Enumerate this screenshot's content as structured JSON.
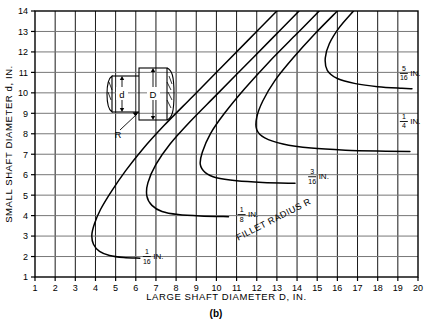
{
  "figure": {
    "caption": "(b)",
    "xlabel": "LARGE SHAFT DIAMETER D, IN.",
    "ylabel": "SMALL SHAFT DIAMETER d, IN.",
    "annotation": "FILLET RADIUS R",
    "inset": {
      "small_diameter_label": "d",
      "large_diameter_label": "D",
      "radius_label": "R"
    },
    "curve_labels": [
      {
        "num": "1",
        "den": "16",
        "unit": "IN."
      },
      {
        "num": "1",
        "den": "8",
        "unit": "IN."
      },
      {
        "num": "3",
        "den": "16",
        "unit": "IN."
      },
      {
        "num": "1",
        "den": "4",
        "unit": "IN."
      },
      {
        "num": "5",
        "den": "16",
        "unit": "IN."
      }
    ]
  },
  "chart_data": {
    "type": "line",
    "title": "",
    "xlabel": "LARGE SHAFT DIAMETER D, IN.",
    "ylabel": "SMALL SHAFT DIAMETER d, IN.",
    "xlim": [
      1,
      20
    ],
    "ylim": [
      1,
      14
    ],
    "xticks": [
      1,
      2,
      3,
      4,
      5,
      6,
      7,
      8,
      9,
      10,
      11,
      12,
      13,
      14,
      15,
      16,
      17,
      18,
      19,
      20
    ],
    "yticks": [
      1,
      2,
      3,
      4,
      5,
      6,
      7,
      8,
      9,
      10,
      11,
      12,
      13,
      14
    ],
    "xtick_labels": [
      "1",
      "2",
      "3",
      "4",
      "5",
      "6",
      "7",
      "8",
      "9",
      "10",
      "11",
      "12",
      "13",
      "14",
      "15",
      "16",
      "17",
      "18",
      "19",
      "20"
    ],
    "ytick_labels": [
      "1",
      "2",
      "3",
      "4",
      "5",
      "6",
      "7",
      "8",
      "9",
      "10",
      "11",
      "12",
      "13",
      "14"
    ],
    "grid": true,
    "legend": "inline labels on curves",
    "annotations": [
      "FILLET RADIUS R",
      "(b)"
    ],
    "series": [
      {
        "name": "1/16 IN.",
        "label": "1/16 IN.",
        "label_at": {
          "x": 6.35,
          "y": 2.0
        },
        "points": [
          {
            "x": 13.0,
            "y": 14.0
          },
          {
            "x": 11.6,
            "y": 12.6
          },
          {
            "x": 10.2,
            "y": 11.2
          },
          {
            "x": 8.8,
            "y": 9.8
          },
          {
            "x": 7.4,
            "y": 8.4
          },
          {
            "x": 6.3,
            "y": 7.2
          },
          {
            "x": 5.5,
            "y": 6.2
          },
          {
            "x": 4.8,
            "y": 5.2
          },
          {
            "x": 4.25,
            "y": 4.3
          },
          {
            "x": 3.95,
            "y": 3.6
          },
          {
            "x": 3.82,
            "y": 3.05
          },
          {
            "x": 3.9,
            "y": 2.6
          },
          {
            "x": 4.2,
            "y": 2.25
          },
          {
            "x": 4.7,
            "y": 2.05
          },
          {
            "x": 5.4,
            "y": 1.95
          },
          {
            "x": 6.2,
            "y": 1.92
          }
        ]
      },
      {
        "name": "1/8 IN.",
        "label": "1/8 IN.",
        "label_at": {
          "x": 11.05,
          "y": 4.05
        },
        "points": [
          {
            "x": 14.1,
            "y": 14.0
          },
          {
            "x": 12.8,
            "y": 12.7
          },
          {
            "x": 11.4,
            "y": 11.3
          },
          {
            "x": 10.0,
            "y": 9.9
          },
          {
            "x": 8.7,
            "y": 8.6
          },
          {
            "x": 7.7,
            "y": 7.5
          },
          {
            "x": 7.0,
            "y": 6.5
          },
          {
            "x": 6.6,
            "y": 5.6
          },
          {
            "x": 6.55,
            "y": 4.95
          },
          {
            "x": 6.8,
            "y": 4.5
          },
          {
            "x": 7.3,
            "y": 4.2
          },
          {
            "x": 8.1,
            "y": 4.05
          },
          {
            "x": 9.2,
            "y": 3.98
          },
          {
            "x": 10.6,
            "y": 3.95
          }
        ]
      },
      {
        "name": "3/16 IN.",
        "label": "3/16 IN.",
        "label_at": {
          "x": 14.55,
          "y": 5.9
        },
        "points": [
          {
            "x": 15.1,
            "y": 14.0
          },
          {
            "x": 13.9,
            "y": 12.8
          },
          {
            "x": 12.6,
            "y": 11.5
          },
          {
            "x": 11.4,
            "y": 10.2
          },
          {
            "x": 10.4,
            "y": 9.0
          },
          {
            "x": 9.7,
            "y": 8.0
          },
          {
            "x": 9.3,
            "y": 7.1
          },
          {
            "x": 9.2,
            "y": 6.5
          },
          {
            "x": 9.45,
            "y": 6.1
          },
          {
            "x": 10.0,
            "y": 5.85
          },
          {
            "x": 11.0,
            "y": 5.7
          },
          {
            "x": 12.3,
            "y": 5.62
          },
          {
            "x": 13.9,
            "y": 5.58
          }
        ]
      },
      {
        "name": "1/4 IN.",
        "label": "1/4 IN.",
        "label_at": {
          "x": 19.1,
          "y": 8.6
        },
        "points": [
          {
            "x": 16.0,
            "y": 14.0
          },
          {
            "x": 14.9,
            "y": 12.9
          },
          {
            "x": 13.8,
            "y": 11.7
          },
          {
            "x": 12.9,
            "y": 10.6
          },
          {
            "x": 12.3,
            "y": 9.6
          },
          {
            "x": 12.0,
            "y": 8.8
          },
          {
            "x": 12.0,
            "y": 8.2
          },
          {
            "x": 12.4,
            "y": 7.8
          },
          {
            "x": 13.3,
            "y": 7.5
          },
          {
            "x": 14.7,
            "y": 7.3
          },
          {
            "x": 16.4,
            "y": 7.2
          },
          {
            "x": 18.4,
            "y": 7.15
          },
          {
            "x": 19.6,
            "y": 7.13
          }
        ]
      },
      {
        "name": "5/16 IN.",
        "label": "5/16 IN.",
        "label_at": {
          "x": 19.1,
          "y": 10.95
        },
        "points": [
          {
            "x": 16.8,
            "y": 14.0
          },
          {
            "x": 16.1,
            "y": 13.2
          },
          {
            "x": 15.6,
            "y": 12.4
          },
          {
            "x": 15.4,
            "y": 11.7
          },
          {
            "x": 15.5,
            "y": 11.1
          },
          {
            "x": 16.0,
            "y": 10.7
          },
          {
            "x": 16.9,
            "y": 10.45
          },
          {
            "x": 18.0,
            "y": 10.3
          },
          {
            "x": 19.2,
            "y": 10.22
          },
          {
            "x": 19.7,
            "y": 10.2
          }
        ]
      }
    ]
  }
}
